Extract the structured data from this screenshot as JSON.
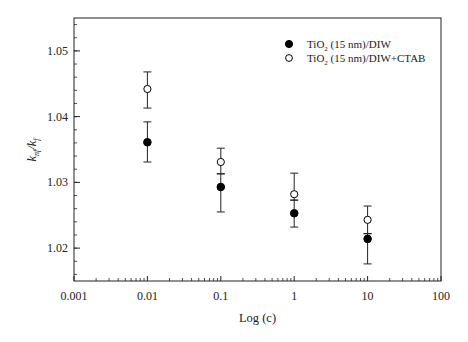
{
  "chart_data": {
    "type": "scatter",
    "title": "",
    "xlabel": "Log (c)",
    "ylabel_main": "k",
    "ylabel_num_sub": "nf",
    "ylabel_den_sub": "f",
    "ylabel": "k_nf/k_f",
    "xscale": "log",
    "xlim": [
      0.001,
      100
    ],
    "ylim": [
      1.015,
      1.055
    ],
    "xticks": [
      0.001,
      0.01,
      0.1,
      1,
      10,
      100
    ],
    "xtick_labels": [
      "0.001",
      "0.01",
      "0.1",
      "1",
      "10",
      "100"
    ],
    "yticks": [
      1.02,
      1.03,
      1.04,
      1.05
    ],
    "ytick_labels": [
      "1.02",
      "1.03",
      "1.04",
      "1.05"
    ],
    "grid": false,
    "legend_position": "top-right",
    "series": [
      {
        "name": "TiO2 (15 nm)/DIW",
        "label_pre": "TiO",
        "label_sub": "2",
        "label_post": " (15 nm)/DIW",
        "marker": "filled-circle",
        "x": [
          0.01,
          0.1,
          1,
          10
        ],
        "y": [
          1.0361,
          1.0293,
          1.0253,
          1.0214
        ],
        "err_low": [
          1.0331,
          1.0255,
          1.0232,
          1.0176
        ],
        "err_high": [
          1.0392,
          1.0313,
          1.0273,
          1.0222
        ]
      },
      {
        "name": "TiO2 (15 nm)/DIW+CTAB",
        "label_pre": "TiO",
        "label_sub": "2",
        "label_post": " (15 nm)/DIW+CTAB",
        "marker": "open-circle",
        "x": [
          0.01,
          0.1,
          1,
          10
        ],
        "y": [
          1.0442,
          1.0331,
          1.0282,
          1.0243
        ],
        "err_low": [
          1.0413,
          1.0313,
          1.0273,
          1.0222
        ],
        "err_high": [
          1.0468,
          1.0352,
          1.0314,
          1.0264
        ]
      }
    ]
  }
}
